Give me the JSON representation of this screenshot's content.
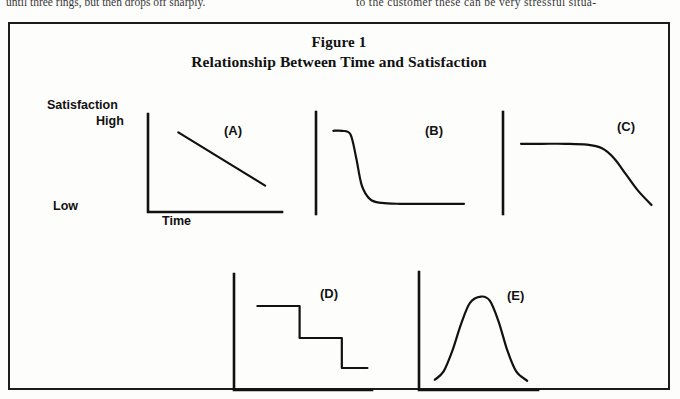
{
  "page_text": {
    "left_column_line": "until three rings, but then drops off sharply.",
    "right_column_line": "to the customer these can be very stressful situa-"
  },
  "figure": {
    "label": "Figure 1",
    "title": "Relationship Between Time and Satisfaction",
    "border_color": "#1c1c1c",
    "background_color": "#fdfdfc",
    "ink_color": "#111111"
  },
  "axes_labels": {
    "y_axis_title": "Satisfaction",
    "y_high": "High",
    "y_low": "Low",
    "x_axis_title": "Time"
  },
  "panel_letters": {
    "a": "(A)",
    "b": "(B)",
    "c": "(C)",
    "d": "(D)",
    "e": "(E)"
  },
  "chart_data": [
    {
      "type": "line",
      "id": "A",
      "title": "(A)",
      "xlabel": "Time",
      "ylabel": "Satisfaction",
      "ylim": [
        0,
        100
      ],
      "xlim": [
        0,
        100
      ],
      "ytick_labels": [
        "Low",
        "High"
      ],
      "grid": false,
      "legend": "none",
      "annotation": "Steady linear decline in satisfaction over time",
      "x": [
        18,
        30,
        45,
        60,
        75,
        88
      ],
      "y": [
        88,
        77,
        63,
        49,
        36,
        26
      ]
    },
    {
      "type": "line",
      "id": "B",
      "title": "(B)",
      "xlabel": "Time",
      "ylabel": "Satisfaction",
      "ylim": [
        0,
        100
      ],
      "xlim": [
        0,
        100
      ],
      "grid": false,
      "legend": "none",
      "annotation": "High satisfaction that collapses very early, then stays flat and low",
      "x": [
        8,
        14,
        20,
        24,
        28,
        34,
        42,
        55,
        70,
        85,
        100
      ],
      "y": [
        90,
        90,
        86,
        60,
        28,
        12,
        8,
        7,
        7,
        7,
        7
      ]
    },
    {
      "type": "line",
      "id": "C",
      "title": "(C)",
      "xlabel": "Time",
      "ylabel": "Satisfaction",
      "ylim": [
        0,
        100
      ],
      "xlim": [
        0,
        100
      ],
      "grid": false,
      "legend": "none",
      "annotation": "Satisfaction holds high for a long time, then falls sharply at the end",
      "x": [
        8,
        22,
        38,
        52,
        62,
        70,
        78,
        86,
        95
      ],
      "y": [
        78,
        78,
        78,
        77,
        73,
        62,
        44,
        26,
        10
      ]
    },
    {
      "type": "line",
      "id": "D",
      "title": "(D)",
      "xlabel": "Time",
      "ylabel": "Satisfaction",
      "ylim": [
        0,
        100
      ],
      "xlim": [
        0,
        100
      ],
      "grid": false,
      "legend": "none",
      "annotation": "Satisfaction drops in discrete steps (staircase)",
      "steps": [
        {
          "x_start": 12,
          "x_end": 45,
          "y": 80
        },
        {
          "x_start": 45,
          "x_end": 78,
          "y": 48
        },
        {
          "x_start": 78,
          "x_end": 98,
          "y": 18
        }
      ]
    },
    {
      "type": "line",
      "id": "E",
      "title": "(E)",
      "xlabel": "Time",
      "ylabel": "Satisfaction",
      "ylim": [
        0,
        100
      ],
      "xlim": [
        0,
        100
      ],
      "grid": false,
      "legend": "none",
      "annotation": "Satisfaction rises to a peak then falls — inverted U / bell curve",
      "x": [
        8,
        16,
        24,
        32,
        40,
        50,
        58,
        66,
        74,
        82,
        92
      ],
      "y": [
        6,
        14,
        34,
        60,
        80,
        86,
        82,
        62,
        34,
        14,
        5
      ]
    }
  ]
}
